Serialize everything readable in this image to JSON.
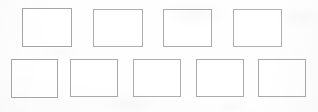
{
  "page": {
    "background_color": "#fefefe",
    "width": 318,
    "height": 112
  },
  "style": {
    "box_border_color": "#a8a8a8",
    "box_border_color_light": "#b5b5b5",
    "box_fill_color": "#ffffff",
    "box_border_width": 1
  },
  "grid": {
    "row_count": 2,
    "total_boxes": 9,
    "rows": [
      {
        "row_label": "row-1",
        "box_count": 4,
        "top": 8,
        "height": 39,
        "boxes": [
          {
            "label": "box-1",
            "left": 22,
            "top": 8,
            "width": 50,
            "height": 39,
            "border_color": "#a6a6a6"
          },
          {
            "label": "box-2",
            "left": 93,
            "top": 9,
            "width": 50,
            "height": 38,
            "border_color": "#aeaeae"
          },
          {
            "label": "box-3",
            "left": 163,
            "top": 9,
            "width": 49,
            "height": 38,
            "border_color": "#ababab"
          },
          {
            "label": "box-4",
            "left": 233,
            "top": 9,
            "width": 49,
            "height": 38,
            "border_color": "#b0b0b0"
          }
        ]
      },
      {
        "row_label": "row-2",
        "box_count": 5,
        "top": 58,
        "height": 39,
        "boxes": [
          {
            "label": "box-5",
            "left": 11,
            "top": 59,
            "width": 47,
            "height": 39,
            "border_color": "#a6a6a6"
          },
          {
            "label": "box-6",
            "left": 70,
            "top": 59,
            "width": 48,
            "height": 38,
            "border_color": "#a9a9a9"
          },
          {
            "label": "box-7",
            "left": 133,
            "top": 59,
            "width": 48,
            "height": 38,
            "border_color": "#adadad"
          },
          {
            "label": "box-8",
            "left": 196,
            "top": 59,
            "width": 48,
            "height": 38,
            "border_color": "#aaaaaa"
          },
          {
            "label": "box-9",
            "left": 258,
            "top": 59,
            "width": 48,
            "height": 38,
            "border_color": "#a8a8a8"
          }
        ]
      }
    ]
  }
}
